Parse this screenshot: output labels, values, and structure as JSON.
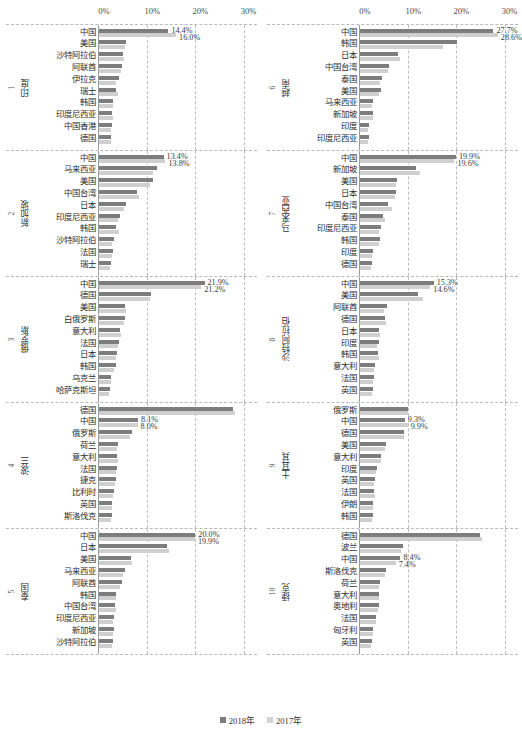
{
  "chart_data": {
    "type": "bar",
    "orientation": "horizontal",
    "title": "",
    "xlabel": "",
    "ylabel": "",
    "xlim": [
      0,
      33
    ],
    "xticks": [
      "0%",
      "10%",
      "20%",
      "30%"
    ],
    "xtick_values": [
      0,
      10,
      20,
      30
    ],
    "grid": true,
    "legend_position": "bottom-center",
    "series": [
      {
        "name": "2018年",
        "key": "y2018",
        "color": "#7d7d7d"
      },
      {
        "name": "2017年",
        "key": "y2017",
        "color": "#cfcfcf"
      }
    ],
    "panels": [
      {
        "index": "1",
        "country": "印度",
        "annotations": [
          "14.4%",
          "16.0%"
        ],
        "categories": [
          "中国",
          "美国",
          "沙特阿拉伯",
          "阿联酋",
          "伊拉克",
          "瑞士",
          "韩国",
          "印度尼西亚",
          "中国香港",
          "德国"
        ],
        "y2018": [
          14.4,
          5.5,
          4.9,
          4.8,
          4.2,
          3.6,
          2.9,
          2.8,
          2.6,
          2.5
        ],
        "y2017": [
          16.0,
          5.3,
          5.1,
          4.6,
          3.6,
          4.0,
          3.0,
          2.9,
          2.5,
          2.4
        ]
      },
      {
        "index": "2",
        "country": "新加坡",
        "annotations": [
          "13.4%",
          "13.8%"
        ],
        "categories": [
          "中国",
          "马来西亚",
          "美国",
          "中国台湾",
          "日本",
          "印度尼西亚",
          "韩国",
          "沙特阿拉伯",
          "法国",
          "瑞士"
        ],
        "y2018": [
          13.4,
          12.0,
          11.3,
          7.9,
          5.6,
          4.3,
          3.6,
          3.2,
          3.0,
          2.4
        ],
        "y2017": [
          13.8,
          11.2,
          10.5,
          8.4,
          5.1,
          3.9,
          4.1,
          2.8,
          2.6,
          2.2
        ]
      },
      {
        "index": "3",
        "country": "俄罗斯",
        "annotations": [
          "21.9%",
          "21.2%"
        ],
        "categories": [
          "中国",
          "德国",
          "美国",
          "白俄罗斯",
          "意大利",
          "法国",
          "日本",
          "韩国",
          "乌克兰",
          "哈萨克斯坦"
        ],
        "y2018": [
          21.9,
          10.7,
          5.4,
          5.3,
          4.4,
          4.2,
          3.7,
          3.5,
          2.5,
          2.3
        ],
        "y2017": [
          21.2,
          10.5,
          5.5,
          5.1,
          4.5,
          3.9,
          3.6,
          3.2,
          2.4,
          2.1
        ]
      },
      {
        "index": "4",
        "country": "波兰",
        "annotations": [
          "8.1%",
          "8.0%"
        ],
        "categories": [
          "德国",
          "中国",
          "俄罗斯",
          "荷兰",
          "意大利",
          "法国",
          "捷克",
          "比利时",
          "英国",
          "斯洛伐克"
        ],
        "y2018": [
          27.9,
          8.1,
          6.8,
          4.0,
          3.8,
          3.7,
          3.5,
          3.2,
          2.7,
          2.6
        ],
        "y2017": [
          28.2,
          8.0,
          6.5,
          3.8,
          3.9,
          3.6,
          3.4,
          3.0,
          2.8,
          2.4
        ]
      },
      {
        "index": "5",
        "country": "泰国",
        "annotations": [
          "20.0%",
          "19.9%"
        ],
        "categories": [
          "中国",
          "日本",
          "美国",
          "马来西亚",
          "阿联酋",
          "韩国",
          "中国台湾",
          "印度尼西亚",
          "新加坡",
          "沙特阿拉伯"
        ],
        "y2018": [
          20.0,
          14.1,
          6.6,
          5.4,
          4.8,
          3.5,
          3.4,
          3.2,
          3.1,
          2.9
        ],
        "y2017": [
          19.9,
          14.5,
          6.8,
          5.0,
          4.4,
          3.6,
          3.5,
          3.0,
          3.0,
          2.8
        ]
      },
      {
        "index": "6",
        "country": "越南",
        "annotations": [
          "27.7%",
          "28.6%"
        ],
        "categories": [
          "中国",
          "韩国",
          "日本",
          "中国台湾",
          "泰国",
          "美国",
          "马来西亚",
          "新加坡",
          "印度",
          "印度尼西亚"
        ],
        "y2018": [
          27.7,
          20.1,
          7.8,
          6.0,
          4.6,
          4.3,
          2.7,
          2.6,
          1.9,
          1.8
        ],
        "y2017": [
          28.6,
          17.3,
          8.4,
          5.8,
          4.2,
          4.0,
          2.5,
          2.7,
          1.7,
          1.6
        ]
      },
      {
        "index": "7",
        "country": "马来西亚",
        "annotations": [
          "19.9%",
          "19.6%"
        ],
        "categories": [
          "中国",
          "新加坡",
          "美国",
          "日本",
          "中国台湾",
          "泰国",
          "印度尼西亚",
          "韩国",
          "印度",
          "德国"
        ],
        "y2018": [
          19.9,
          11.7,
          7.7,
          7.5,
          5.8,
          4.7,
          4.4,
          4.2,
          2.6,
          2.5
        ],
        "y2017": [
          19.6,
          12.5,
          7.4,
          7.3,
          6.6,
          5.1,
          4.0,
          4.0,
          2.4,
          2.3
        ]
      },
      {
        "index": "8",
        "country": "沙特阿拉伯",
        "annotations": [
          "15.3%",
          "14.6%"
        ],
        "categories": [
          "中国",
          "美国",
          "阿联酋",
          "德国",
          "日本",
          "印度",
          "韩国",
          "意大利",
          "法国",
          "英国"
        ],
        "y2018": [
          15.3,
          12.1,
          5.5,
          5.2,
          4.0,
          3.9,
          3.7,
          3.1,
          2.9,
          2.6
        ],
        "y2017": [
          14.6,
          13.1,
          5.0,
          5.4,
          4.2,
          3.5,
          3.9,
          3.0,
          2.8,
          2.5
        ]
      },
      {
        "index": "9",
        "country": "土耳其",
        "annotations": [
          "9.3%",
          "9.9%"
        ],
        "categories": [
          "俄罗斯",
          "中国",
          "德国",
          "美国",
          "意大利",
          "印度",
          "英国",
          "法国",
          "伊朗",
          "韩国"
        ],
        "y2018": [
          9.9,
          9.3,
          9.1,
          5.4,
          4.4,
          3.6,
          3.1,
          3.0,
          2.8,
          2.6
        ],
        "y2017": [
          9.9,
          9.9,
          9.2,
          5.1,
          4.3,
          3.3,
          3.0,
          3.1,
          2.6,
          2.5
        ]
      },
      {
        "index": "10",
        "country": "捷克",
        "annotations": [
          "8.4%",
          "7.4%"
        ],
        "categories": [
          "德国",
          "波兰",
          "中国",
          "斯洛伐克",
          "荷兰",
          "意大利",
          "奥地利",
          "法国",
          "匈牙利",
          "英国"
        ],
        "y2018": [
          24.9,
          8.9,
          8.4,
          5.4,
          4.2,
          4.0,
          3.9,
          3.4,
          2.7,
          2.4
        ],
        "y2017": [
          25.4,
          8.6,
          7.4,
          5.2,
          4.0,
          3.9,
          3.7,
          3.3,
          2.6,
          2.3
        ]
      }
    ]
  },
  "legend": {
    "items": [
      {
        "label": "2018年"
      },
      {
        "label": "2017年"
      }
    ]
  }
}
